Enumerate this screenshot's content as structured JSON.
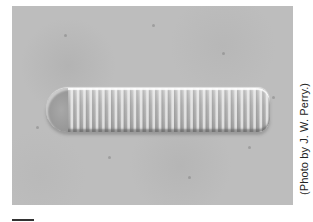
{
  "figure": {
    "credit": "(Photo by J. W. Perry.)",
    "colors": {
      "background": "#bdbdbd",
      "page": "#ffffff",
      "text": "#222222"
    }
  }
}
